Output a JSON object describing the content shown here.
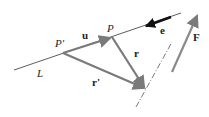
{
  "diagram": {
    "title": "",
    "colors": {
      "line": "#333333",
      "vector_gray": "#7a7a7a",
      "unit_vector": "#111111",
      "label": "#222222"
    },
    "labels": {
      "point_p_prime": "P'",
      "point_p": "P",
      "vector_u": "u",
      "vector_r": "r",
      "vector_r_prime": "r'",
      "vector_e": "e",
      "force_F": "F",
      "line_L": "L"
    }
  }
}
